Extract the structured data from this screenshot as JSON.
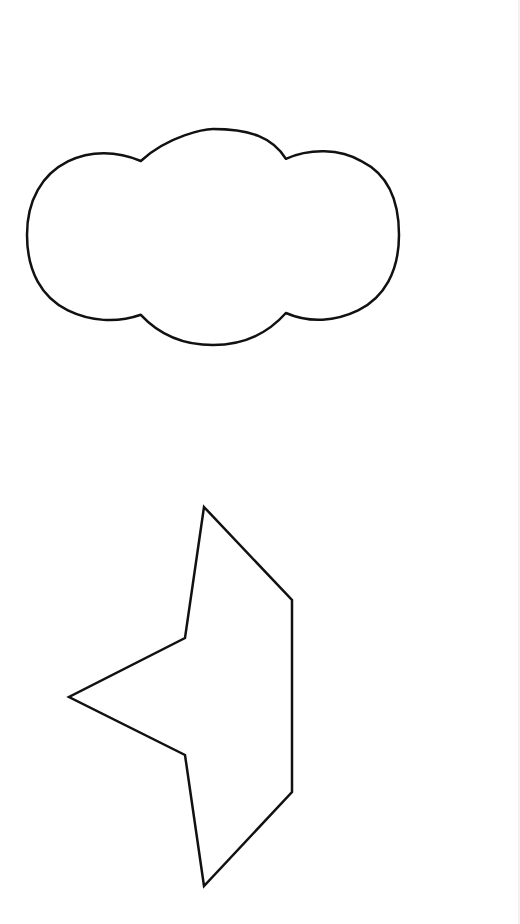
{
  "canvas": {
    "width": 520,
    "height": 924,
    "background": "#ffffff"
  },
  "shapes": [
    {
      "id": "cloud",
      "type": "cloud",
      "stroke": "#111111",
      "fill": "#ffffff",
      "stroke_width": 2.5,
      "bbox": {
        "x": 27,
        "y": 129,
        "width": 372,
        "height": 216
      }
    },
    {
      "id": "polygon",
      "type": "concave-heptagon",
      "stroke": "#111111",
      "fill": "#ffffff",
      "stroke_width": 2.5,
      "points": [
        [
          204,
          507
        ],
        [
          292,
          600
        ],
        [
          292,
          792
        ],
        [
          204,
          886
        ],
        [
          185,
          755
        ],
        [
          69,
          697
        ],
        [
          185,
          638
        ]
      ]
    }
  ],
  "edge": {
    "color": "#f2f2f2"
  }
}
